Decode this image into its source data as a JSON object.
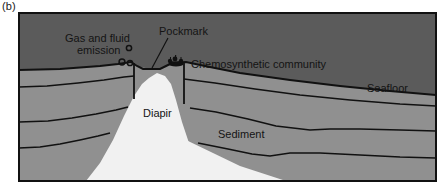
{
  "figure": {
    "panel_label": "(b)",
    "caption_type": "geological-cross-section",
    "labels": {
      "gas_line1": "Gas and fluid",
      "gas_line2": "emission",
      "pockmark": "Pockmark",
      "chemosynthetic": "Chemosynthetic community",
      "seafloor": "Seafloor",
      "diapir": "Diapir",
      "sediment": "Sediment"
    },
    "colors": {
      "water": "#5b5b5b",
      "sediment": "#909090",
      "diapir": "#f1f1f1",
      "stroke": "#111111",
      "frame": "#111111",
      "text": "#141414",
      "background": "#ffffff"
    },
    "features": {
      "bubble_count": 3,
      "sediment_layer_count": 3,
      "fault_count": 2,
      "frame": {
        "x": 18,
        "y": 12,
        "width": 419,
        "height": 170
      }
    }
  }
}
